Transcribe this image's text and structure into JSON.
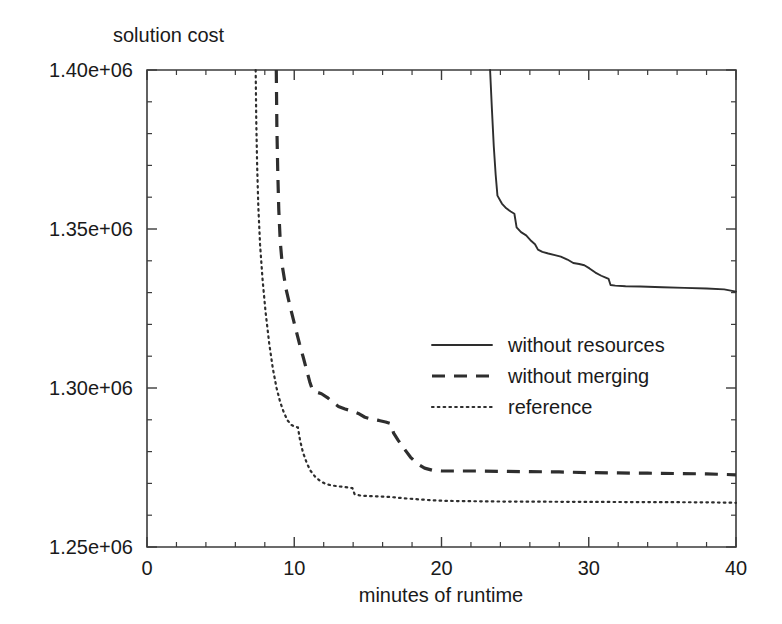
{
  "chart_data": {
    "type": "line",
    "title": "",
    "ylabel": "solution cost",
    "xlabel": "minutes of runtime",
    "xlim": [
      0,
      40
    ],
    "ylim": [
      1250000,
      1400000
    ],
    "xticks": [
      0,
      10,
      20,
      30,
      40
    ],
    "xticklabels": [
      "0",
      "10",
      "20",
      "30",
      "40"
    ],
    "yticks": [
      1250000,
      1300000,
      1350000,
      1400000
    ],
    "yticklabels": [
      "1.25e+06",
      "1.30e+06",
      "1.35e+06",
      "1.40e+06"
    ],
    "xminor_step": 2,
    "yminor_step": 10000,
    "grid": false,
    "legend_position": "center",
    "series": [
      {
        "name": "without resources",
        "style": "solid",
        "points": [
          [
            23.3,
            1400000
          ],
          [
            23.42,
            1388000
          ],
          [
            23.55,
            1376000
          ],
          [
            23.68,
            1367000
          ],
          [
            23.8,
            1360500
          ],
          [
            24.1,
            1358000
          ],
          [
            24.4,
            1356500
          ],
          [
            24.7,
            1355500
          ],
          [
            24.95,
            1354800
          ],
          [
            25.1,
            1350500
          ],
          [
            25.4,
            1349000
          ],
          [
            25.75,
            1348000
          ],
          [
            26.1,
            1346200
          ],
          [
            26.35,
            1345200
          ],
          [
            26.55,
            1343500
          ],
          [
            26.85,
            1342800
          ],
          [
            27.25,
            1342300
          ],
          [
            27.7,
            1341800
          ],
          [
            28.1,
            1341300
          ],
          [
            28.55,
            1340400
          ],
          [
            28.95,
            1339300
          ],
          [
            29.35,
            1339000
          ],
          [
            29.7,
            1338600
          ],
          [
            30.05,
            1337600
          ],
          [
            30.45,
            1336300
          ],
          [
            30.85,
            1335300
          ],
          [
            31.15,
            1334700
          ],
          [
            31.35,
            1334300
          ],
          [
            31.48,
            1332400
          ],
          [
            31.8,
            1332200
          ],
          [
            32.5,
            1332000
          ],
          [
            33.5,
            1331900
          ],
          [
            35.0,
            1331700
          ],
          [
            36.5,
            1331500
          ],
          [
            38.0,
            1331300
          ],
          [
            39.2,
            1331000
          ],
          [
            40.0,
            1330300
          ]
        ]
      },
      {
        "name": "without merging",
        "style": "dashed",
        "points": [
          [
            8.78,
            1400000
          ],
          [
            8.82,
            1382000
          ],
          [
            8.88,
            1368000
          ],
          [
            8.95,
            1356000
          ],
          [
            9.05,
            1346000
          ],
          [
            9.2,
            1338000
          ],
          [
            9.45,
            1331000
          ],
          [
            9.75,
            1325000
          ],
          [
            10.05,
            1319500
          ],
          [
            10.35,
            1314000
          ],
          [
            10.62,
            1309500
          ],
          [
            10.85,
            1305500
          ],
          [
            11.05,
            1302000
          ],
          [
            11.22,
            1299600
          ],
          [
            11.45,
            1298800
          ],
          [
            11.85,
            1298200
          ],
          [
            12.25,
            1297000
          ],
          [
            12.65,
            1295400
          ],
          [
            13.0,
            1294200
          ],
          [
            13.45,
            1293400
          ],
          [
            13.9,
            1292800
          ],
          [
            14.35,
            1292000
          ],
          [
            14.8,
            1290800
          ],
          [
            15.25,
            1290200
          ],
          [
            15.75,
            1289800
          ],
          [
            16.2,
            1289300
          ],
          [
            16.55,
            1288800
          ],
          [
            16.75,
            1285800
          ],
          [
            17.05,
            1283600
          ],
          [
            17.45,
            1281000
          ],
          [
            17.9,
            1278200
          ],
          [
            18.35,
            1276200
          ],
          [
            18.85,
            1274800
          ],
          [
            19.4,
            1274100
          ],
          [
            20.0,
            1273900
          ],
          [
            21.0,
            1273900
          ],
          [
            22.5,
            1273900
          ],
          [
            24.0,
            1273800
          ],
          [
            26.0,
            1273700
          ],
          [
            28.0,
            1273600
          ],
          [
            30.0,
            1273400
          ],
          [
            32.0,
            1273300
          ],
          [
            34.0,
            1273200
          ],
          [
            36.0,
            1273100
          ],
          [
            38.0,
            1273000
          ],
          [
            40.0,
            1272700
          ]
        ]
      },
      {
        "name": "reference",
        "style": "dotted",
        "points": [
          [
            7.38,
            1400000
          ],
          [
            7.42,
            1384000
          ],
          [
            7.48,
            1370000
          ],
          [
            7.56,
            1357000
          ],
          [
            7.68,
            1345000
          ],
          [
            7.85,
            1334000
          ],
          [
            8.05,
            1324000
          ],
          [
            8.3,
            1314000
          ],
          [
            8.55,
            1306000
          ],
          [
            8.8,
            1300000
          ],
          [
            9.05,
            1295500
          ],
          [
            9.3,
            1292200
          ],
          [
            9.55,
            1289800
          ],
          [
            9.8,
            1288400
          ],
          [
            10.05,
            1287800
          ],
          [
            10.25,
            1287600
          ],
          [
            10.4,
            1283400
          ],
          [
            10.6,
            1279600
          ],
          [
            10.85,
            1276400
          ],
          [
            11.1,
            1274000
          ],
          [
            11.4,
            1272200
          ],
          [
            11.75,
            1270800
          ],
          [
            12.1,
            1269900
          ],
          [
            12.5,
            1269400
          ],
          [
            12.95,
            1269100
          ],
          [
            13.35,
            1268900
          ],
          [
            13.7,
            1268700
          ],
          [
            13.95,
            1268500
          ],
          [
            14.1,
            1266600
          ],
          [
            14.45,
            1266200
          ],
          [
            15.0,
            1266000
          ],
          [
            15.8,
            1265900
          ],
          [
            16.6,
            1265700
          ],
          [
            17.5,
            1265300
          ],
          [
            18.4,
            1265000
          ],
          [
            19.3,
            1264700
          ],
          [
            20.3,
            1264500
          ],
          [
            22.0,
            1264400
          ],
          [
            24.0,
            1264300
          ],
          [
            26.5,
            1264250
          ],
          [
            29.0,
            1264200
          ],
          [
            32.0,
            1264150
          ],
          [
            35.0,
            1264100
          ],
          [
            38.0,
            1264050
          ],
          [
            40.0,
            1263900
          ]
        ]
      }
    ],
    "legend": [
      {
        "label": "without resources",
        "style": "solid"
      },
      {
        "label": "without merging",
        "style": "dashed"
      },
      {
        "label": "reference",
        "style": "dotted"
      }
    ]
  }
}
